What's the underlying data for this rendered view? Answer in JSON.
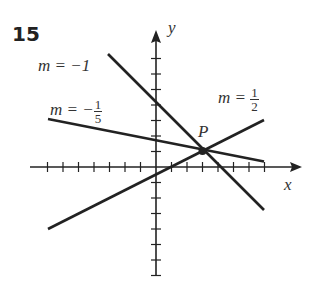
{
  "problem_number": "15",
  "axes": {
    "x_label": "x",
    "y_label": "y"
  },
  "point": {
    "label": "P",
    "coords": [
      3,
      1
    ]
  },
  "lines": [
    {
      "label_prefix": "m = −1",
      "slope": -1,
      "equation": "y = -x + 4"
    },
    {
      "label_prefix": "m = −",
      "numerator": "1",
      "denominator": "5",
      "slope": -0.2,
      "equation": "y = -x/5 + 8/5"
    },
    {
      "label_prefix": "m = ",
      "numerator": "1",
      "denominator": "2",
      "slope": 0.5,
      "equation": "y = x/2 - 1/2"
    }
  ]
}
